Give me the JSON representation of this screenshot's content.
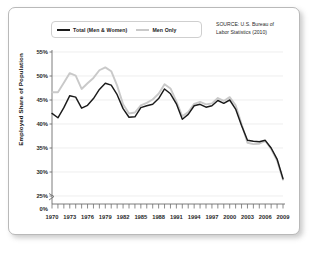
{
  "figure": {
    "source_note": "SOURCE: U.S. Bureau of Labor Statistics (2010)",
    "source_line1": "SOURCE: U.S. Bureau of",
    "source_line2": "Labor Statistics (2010)"
  },
  "colors": {
    "total_line": "#1b1b1b",
    "men_line": "#c9c9c9",
    "gridline": "#e6e6e6",
    "axis": "#6e6e6e",
    "frame_border": "#b9b9b9",
    "background": "#ffffff",
    "text": "#2a2a2a"
  },
  "legend": {
    "position": "top-left-inside",
    "items": [
      {
        "label": "Total (Men & Women)",
        "color": "#1b1b1b"
      },
      {
        "label": "Men Only",
        "color": "#c9c9c9"
      }
    ]
  },
  "chart_data": {
    "type": "line",
    "title": "",
    "subtitle": "",
    "xlabel": "",
    "ylabel": "Employed Share of Population",
    "xlim": [
      1970,
      2009
    ],
    "ylim": [
      25,
      55
    ],
    "y_axis_break": true,
    "y_axis_break_note": "Axis broken between 0% and 25%",
    "grid": true,
    "grid_axis": "y",
    "ytick_labels": [
      "55%",
      "50%",
      "45%",
      "40%",
      "35%",
      "30%",
      "25%",
      "0%"
    ],
    "ytick_values": [
      55,
      50,
      45,
      40,
      35,
      30,
      25,
      0
    ],
    "xtick_labels": [
      "1970",
      "1973",
      "1976",
      "1979",
      "1982",
      "1985",
      "1988",
      "1991",
      "1994",
      "1997",
      "2000",
      "2003",
      "2006",
      "2009"
    ],
    "xtick_values": [
      1970,
      1973,
      1976,
      1979,
      1982,
      1985,
      1988,
      1991,
      1994,
      1997,
      2000,
      2003,
      2006,
      2009
    ],
    "minor_ticks": "every year",
    "x": [
      1970,
      1971,
      1972,
      1973,
      1974,
      1975,
      1976,
      1977,
      1978,
      1979,
      1980,
      1981,
      1982,
      1983,
      1984,
      1985,
      1986,
      1987,
      1988,
      1989,
      1990,
      1991,
      1992,
      1993,
      1994,
      1995,
      1996,
      1997,
      1998,
      1999,
      2000,
      2001,
      2002,
      2003,
      2004,
      2005,
      2006,
      2007,
      2008,
      2009
    ],
    "series": [
      {
        "name": "Total (Men & Women)",
        "color": "#1b1b1b",
        "values": [
          42.2,
          41.3,
          43.4,
          45.9,
          45.6,
          43.3,
          43.9,
          45.3,
          47.2,
          48.5,
          48.1,
          46.1,
          43.2,
          41.4,
          41.5,
          43.4,
          43.8,
          44.1,
          45.3,
          47.3,
          46.3,
          44.2,
          41.0,
          42.0,
          43.8,
          44.1,
          43.5,
          43.8,
          44.9,
          44.3,
          45.0,
          43.1,
          39.7,
          36.6,
          36.4,
          36.3,
          36.6,
          35.0,
          32.7,
          28.6
        ]
      },
      {
        "name": "Men Only",
        "color": "#c9c9c9",
        "values": [
          46.6,
          46.6,
          48.6,
          50.6,
          50.1,
          47.3,
          48.5,
          49.6,
          51.2,
          51.8,
          51.0,
          48.0,
          44.1,
          42.2,
          42.4,
          43.9,
          44.4,
          45.1,
          46.3,
          48.3,
          47.4,
          44.7,
          41.6,
          42.5,
          44.2,
          44.6,
          44.1,
          44.3,
          45.4,
          44.8,
          45.6,
          43.9,
          40.0,
          36.1,
          35.8,
          35.9,
          36.5,
          34.8,
          32.4,
          28.4
        ]
      }
    ]
  }
}
